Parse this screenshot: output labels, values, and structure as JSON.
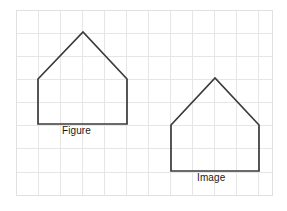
{
  "diagram": {
    "background_color": "#ffffff",
    "grid": {
      "line_color": "#e6e6e6",
      "border_color": "#e0e0e0",
      "x_start": 16,
      "y_start": 10,
      "x_end": 272,
      "y_end": 195,
      "cell_width": 22,
      "cell_height": 23,
      "columns": 12,
      "rows": 8,
      "x_lines": [
        16,
        38,
        60,
        82,
        104,
        126,
        148,
        170,
        192,
        214,
        236,
        258,
        272
      ],
      "y_lines": [
        10,
        33,
        56,
        79,
        102,
        125,
        148,
        172,
        195
      ]
    },
    "shapes": [
      {
        "name": "figure",
        "label": "Figure",
        "stroke_color": "#3a3a3a",
        "stroke_width": 1.7,
        "fill": "none",
        "points": "38,124 38,79 83,32 127,79 127,124",
        "vertices": [
          {
            "x": 38,
            "y": 124
          },
          {
            "x": 38,
            "y": 79
          },
          {
            "x": 83,
            "y": 32
          },
          {
            "x": 127,
            "y": 79
          },
          {
            "x": 127,
            "y": 124
          }
        ],
        "label_position": {
          "x": 62,
          "y": 125
        }
      },
      {
        "name": "image",
        "label": "Image",
        "stroke_color": "#3a3a3a",
        "stroke_width": 1.7,
        "fill": "none",
        "points": "171,171 171,125 215,78 259,125 259,171",
        "vertices": [
          {
            "x": 171,
            "y": 171
          },
          {
            "x": 171,
            "y": 125
          },
          {
            "x": 215,
            "y": 78
          },
          {
            "x": 259,
            "y": 125
          },
          {
            "x": 259,
            "y": 171
          }
        ],
        "label_position": {
          "x": 197,
          "y": 172
        }
      }
    ]
  }
}
